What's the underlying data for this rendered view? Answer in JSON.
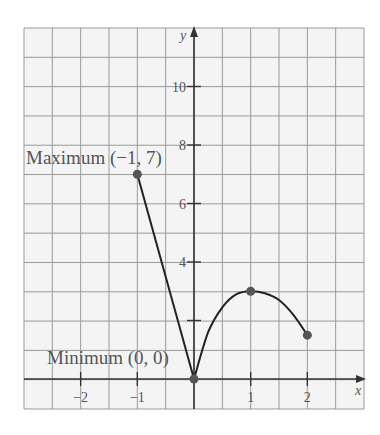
{
  "chart_data": {
    "type": "line",
    "title": "",
    "xlabel": "x",
    "ylabel": "y",
    "xlim": [
      -3,
      3
    ],
    "ylim": [
      -1,
      12
    ],
    "grid": true,
    "x_ticks": [
      -2,
      -1,
      1,
      2
    ],
    "x_tick_labels": [
      "−2",
      "−1",
      "1",
      "2"
    ],
    "y_ticks": [
      2,
      4,
      6,
      8,
      10
    ],
    "y_tick_labels": [
      "",
      "4",
      "6",
      "8",
      "10"
    ],
    "series": [
      {
        "name": "segment",
        "kind": "straight",
        "points": [
          [
            -1,
            7
          ],
          [
            0,
            0
          ]
        ]
      },
      {
        "name": "curve",
        "kind": "curved",
        "points": [
          [
            0,
            0
          ],
          [
            0.25,
            1.6
          ],
          [
            0.5,
            2.45
          ],
          [
            0.75,
            2.9
          ],
          [
            1,
            3
          ],
          [
            1.25,
            2.93
          ],
          [
            1.5,
            2.7
          ],
          [
            1.75,
            2.2
          ],
          [
            2,
            1.5
          ]
        ]
      }
    ],
    "marked_points": [
      [
        -1,
        7
      ],
      [
        0,
        0
      ],
      [
        1,
        3
      ],
      [
        2,
        1.5
      ]
    ],
    "annotations": [
      {
        "text": "Maximum (−1, 7)",
        "point": [
          -1,
          7
        ]
      },
      {
        "text": "Minimum (0, 0)",
        "point": [
          0,
          0
        ]
      }
    ]
  },
  "labels": {
    "x_axis": "x",
    "y_axis": "y",
    "max": "Maximum (−1, 7)",
    "min": "Minimum (0, 0)"
  },
  "colors": {
    "grid": "#9a9a9a",
    "axis": "#333333",
    "curve": "#222222",
    "point": "#555555",
    "text": "#555555"
  }
}
